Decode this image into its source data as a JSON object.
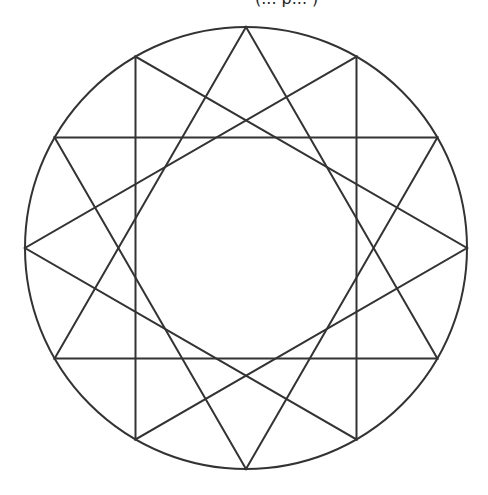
{
  "figure": {
    "caption_clipped": "(... p... )",
    "stroke_color": "#333333",
    "background": "#ffffff",
    "circle": {
      "cx": 246,
      "cy": 248,
      "r": 221
    },
    "vertex_count": 12,
    "step": 4,
    "triangles": [
      {
        "name": "triangle-1",
        "vertex_angles_deg": [
          90,
          210,
          330
        ]
      },
      {
        "name": "triangle-2",
        "vertex_angles_deg": [
          60,
          180,
          300
        ]
      },
      {
        "name": "triangle-3",
        "vertex_angles_deg": [
          120,
          240,
          0
        ]
      },
      {
        "name": "triangle-4",
        "vertex_angles_deg": [
          150,
          270,
          30
        ]
      }
    ]
  }
}
